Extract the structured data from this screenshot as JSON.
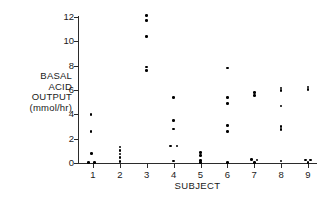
{
  "chart_data": {
    "type": "scatter",
    "title": "",
    "xlabel": "SUBJECT",
    "ylabel_lines": [
      "BASAL",
      "ACID",
      "OUTPUT",
      "(mmol/hr)"
    ],
    "ylabel": "BASAL ACID OUTPUT (mmol/hr)",
    "xlim": [
      0.4,
      9.7
    ],
    "ylim": [
      0,
      12.4
    ],
    "grid": false,
    "legend": null,
    "xticks": [
      1,
      2,
      3,
      4,
      5,
      6,
      7,
      8,
      9
    ],
    "xtick_labels": [
      "1",
      "2",
      "3",
      "4",
      "5",
      "6",
      "7",
      "8",
      "9"
    ],
    "yticks": [
      0,
      2,
      4,
      6,
      8,
      10,
      12
    ],
    "ytick_labels": [
      "0",
      "2",
      "4",
      "6",
      "8",
      "10",
      "12"
    ],
    "series": [
      {
        "name": "Basal acid output by subject",
        "points": [
          {
            "x": 0.93,
            "y": 4.0
          },
          {
            "x": 0.93,
            "y": 2.6
          },
          {
            "x": 0.95,
            "y": 0.8
          },
          {
            "x": 0.83,
            "y": 0.05
          },
          {
            "x": 1.05,
            "y": 0.05
          },
          {
            "x": 2.0,
            "y": 1.3
          },
          {
            "x": 2.0,
            "y": 1.05
          },
          {
            "x": 2.0,
            "y": 0.75
          },
          {
            "x": 2.0,
            "y": 0.45
          },
          {
            "x": 2.0,
            "y": 0.1
          },
          {
            "x": 3.0,
            "y": 12.1
          },
          {
            "x": 3.0,
            "y": 11.7
          },
          {
            "x": 3.0,
            "y": 10.4
          },
          {
            "x": 3.0,
            "y": 7.9
          },
          {
            "x": 3.0,
            "y": 7.6
          },
          {
            "x": 4.0,
            "y": 5.4
          },
          {
            "x": 4.0,
            "y": 3.5
          },
          {
            "x": 4.0,
            "y": 2.8
          },
          {
            "x": 3.88,
            "y": 1.4
          },
          {
            "x": 4.12,
            "y": 1.4
          },
          {
            "x": 4.0,
            "y": 0.15
          },
          {
            "x": 5.0,
            "y": 0.85
          },
          {
            "x": 5.0,
            "y": 0.6
          },
          {
            "x": 5.0,
            "y": 0.2
          },
          {
            "x": 5.0,
            "y": 0.05
          },
          {
            "x": 6.0,
            "y": 7.8
          },
          {
            "x": 6.0,
            "y": 5.4
          },
          {
            "x": 6.0,
            "y": 4.9
          },
          {
            "x": 6.0,
            "y": 3.1
          },
          {
            "x": 6.0,
            "y": 2.6
          },
          {
            "x": 6.0,
            "y": 0.05
          },
          {
            "x": 7.0,
            "y": 5.8
          },
          {
            "x": 7.0,
            "y": 5.55
          },
          {
            "x": 6.9,
            "y": 0.3
          },
          {
            "x": 7.1,
            "y": 0.25
          },
          {
            "x": 7.0,
            "y": 0.05
          },
          {
            "x": 8.0,
            "y": 6.15
          },
          {
            "x": 8.0,
            "y": 5.95
          },
          {
            "x": 8.0,
            "y": 4.7
          },
          {
            "x": 8.0,
            "y": 3.0
          },
          {
            "x": 8.0,
            "y": 2.75
          },
          {
            "x": 8.0,
            "y": 0.15
          },
          {
            "x": 9.0,
            "y": 6.25
          },
          {
            "x": 9.0,
            "y": 6.05
          },
          {
            "x": 8.9,
            "y": 0.25
          },
          {
            "x": 9.1,
            "y": 0.25
          },
          {
            "x": 9.0,
            "y": 0.05
          }
        ]
      }
    ]
  }
}
